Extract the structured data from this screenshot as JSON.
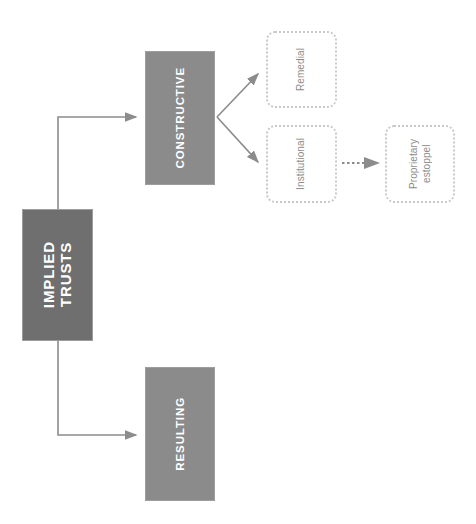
{
  "diagram": {
    "title": "Implied Trusts",
    "colors": {
      "root_fill": "#6f6f6f",
      "branch_fill": "#8b8b8b",
      "node_text": "#ffffff",
      "dotted_border": "#c9c9c9",
      "dotted_text": "#8c8c8c",
      "connector": "#8c8c8c",
      "background": "#ffffff"
    },
    "nodes": {
      "implied_trusts": {
        "label": "IMPLIED\nTRUSTS",
        "style": "solid"
      },
      "constructive": {
        "label": "CONSTRUCTIVE",
        "style": "solid"
      },
      "resulting": {
        "label": "RESULTING",
        "style": "solid"
      },
      "remedial": {
        "label": "Remedial",
        "style": "dotted"
      },
      "institutional": {
        "label": "Institutional",
        "style": "dotted"
      },
      "proprietary_estoppel": {
        "label": "Proprietary\nestoppel",
        "style": "dotted"
      }
    },
    "edges": [
      {
        "from": "implied_trusts",
        "to": "constructive",
        "style": "solid-elbow"
      },
      {
        "from": "implied_trusts",
        "to": "resulting",
        "style": "solid-elbow"
      },
      {
        "from": "constructive",
        "to": "remedial",
        "style": "solid-diagonal"
      },
      {
        "from": "constructive",
        "to": "institutional",
        "style": "solid-diagonal"
      },
      {
        "from": "institutional",
        "to": "proprietary_estoppel",
        "style": "dotted-straight"
      }
    ]
  }
}
